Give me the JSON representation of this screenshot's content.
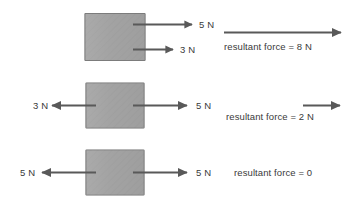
{
  "diagram": {
    "background_color": "#ffffff",
    "block_fill_color": "#a3a3a3",
    "block_border_color": "#6e6e6e",
    "arrow_color": "#595959",
    "text_color": "#3a3a3a",
    "rows": [
      {
        "id": "row-1",
        "block_label": "",
        "forces": [
          {
            "name": "force-right-top",
            "label": "5 N",
            "magnitude": 5,
            "unit": "N",
            "direction": "right"
          },
          {
            "name": "force-right-bottom",
            "label": "3 N",
            "magnitude": 3,
            "unit": "N",
            "direction": "right"
          }
        ],
        "resultant": {
          "text": "resultant force = 8 N",
          "magnitude": 8,
          "unit": "N",
          "direction": "right",
          "has_arrow": true
        }
      },
      {
        "id": "row-2",
        "block_label": "",
        "forces": [
          {
            "name": "force-left",
            "label": "3 N",
            "magnitude": 3,
            "unit": "N",
            "direction": "left"
          },
          {
            "name": "force-right",
            "label": "5 N",
            "magnitude": 5,
            "unit": "N",
            "direction": "right"
          }
        ],
        "resultant": {
          "text": "resultant force = 2 N",
          "magnitude": 2,
          "unit": "N",
          "direction": "right",
          "has_arrow": true
        }
      },
      {
        "id": "row-3",
        "block_label": "",
        "forces": [
          {
            "name": "force-left",
            "label": "5 N",
            "magnitude": 5,
            "unit": "N",
            "direction": "left"
          },
          {
            "name": "force-right",
            "label": "5 N",
            "magnitude": 5,
            "unit": "N",
            "direction": "right"
          }
        ],
        "resultant": {
          "text": "resultant force = 0",
          "magnitude": 0,
          "unit": "",
          "direction": "none",
          "has_arrow": false
        }
      }
    ]
  }
}
